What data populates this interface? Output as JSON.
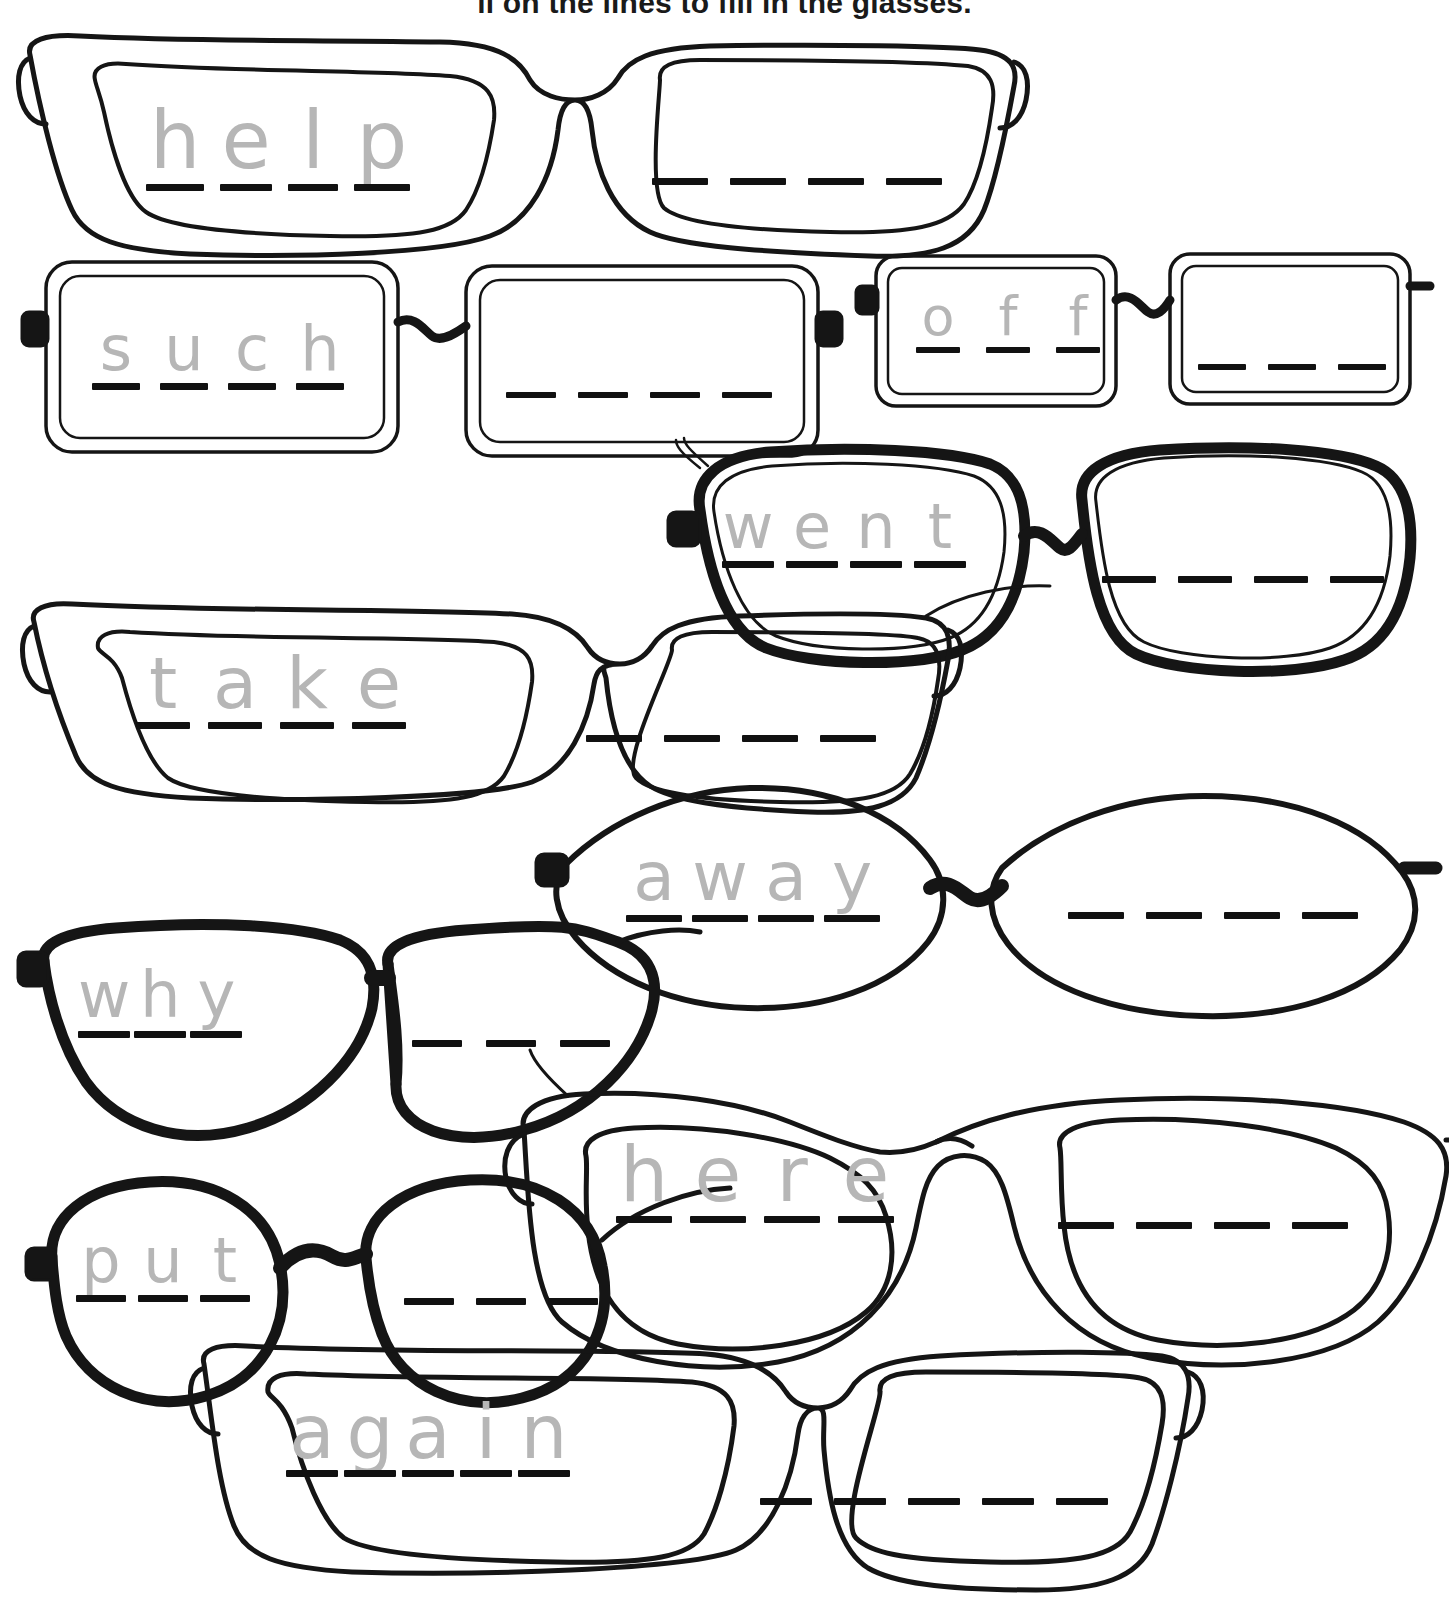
{
  "worksheet": {
    "title": "ll on the lines to fill in the glasses.",
    "trace_color": "#b6b6b6",
    "ink_color": "#111111",
    "background": "#ffffff"
  },
  "items": [
    {
      "id": "help",
      "frame_style": "thick-square-wayfarer",
      "trace_word": "help",
      "trace_letters": [
        "h",
        "e",
        "l",
        "p"
      ],
      "blank_count": 4
    },
    {
      "id": "such",
      "frame_style": "thin-rounded-rectangle",
      "trace_word": "such",
      "trace_letters": [
        "s",
        "u",
        "c",
        "h"
      ],
      "blank_count": 4
    },
    {
      "id": "off",
      "frame_style": "thin-rounded-rectangle-small",
      "trace_word": "off",
      "trace_letters": [
        "o",
        "f",
        "f"
      ],
      "blank_count": 3
    },
    {
      "id": "went",
      "frame_style": "thick-round",
      "trace_word": "went",
      "trace_letters": [
        "w",
        "e",
        "n",
        "t"
      ],
      "blank_count": 4
    },
    {
      "id": "take",
      "frame_style": "thin-bold-rectangle",
      "trace_word": "take",
      "trace_letters": [
        "t",
        "a",
        "k",
        "e"
      ],
      "blank_count": 4
    },
    {
      "id": "away",
      "frame_style": "pointed-oval-lens",
      "trace_word": "away",
      "trace_letters": [
        "a",
        "w",
        "a",
        "y"
      ],
      "blank_count": 4
    },
    {
      "id": "why",
      "frame_style": "thick-aviator",
      "trace_word": "why",
      "trace_letters": [
        "w",
        "h",
        "y"
      ],
      "blank_count": 3
    },
    {
      "id": "here",
      "frame_style": "thin-round-cateye",
      "trace_word": "here",
      "trace_letters": [
        "h",
        "e",
        "r",
        "e"
      ],
      "blank_count": 4
    },
    {
      "id": "put",
      "frame_style": "thick-circle",
      "trace_word": "put",
      "trace_letters": [
        "p",
        "u",
        "t"
      ],
      "blank_count": 3
    },
    {
      "id": "again",
      "frame_style": "thin-square-wayfarer",
      "trace_word": "again",
      "trace_letters": [
        "a",
        "g",
        "a",
        "i",
        "n"
      ],
      "blank_count": 5
    }
  ]
}
